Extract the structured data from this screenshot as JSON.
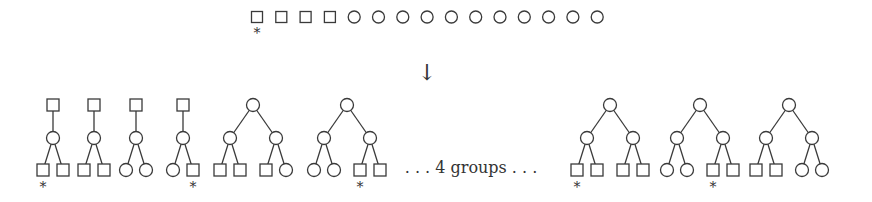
{
  "diagram": {
    "top_row": {
      "nodes": [
        "square",
        "square",
        "square",
        "square",
        "circle",
        "circle",
        "circle",
        "circle",
        "circle",
        "circle",
        "circle",
        "circle",
        "circle",
        "circle",
        "circle"
      ],
      "starred_index": 0
    },
    "arrow": "↓",
    "groups_label": ". . . 4 groups . . .",
    "star_glyph": "*",
    "trees_left": [
      {
        "type": "chain",
        "root": "square",
        "mid": "circle",
        "leaves": [
          "square",
          "square"
        ],
        "star_leaf": 0
      },
      {
        "type": "chain",
        "root": "square",
        "mid": "circle",
        "leaves": [
          "square",
          "square"
        ],
        "star_leaf": null
      },
      {
        "type": "chain",
        "root": "square",
        "mid": "circle",
        "leaves": [
          "circle",
          "circle"
        ],
        "star_leaf": null
      },
      {
        "type": "chain",
        "root": "square",
        "mid": "circle",
        "leaves": [
          "circle",
          "square"
        ],
        "star_leaf": 1
      },
      {
        "type": "binary",
        "root": "circle",
        "mids": [
          "circle",
          "circle"
        ],
        "leaves": [
          "square",
          "square",
          "square",
          "circle"
        ],
        "star_leaf": null
      },
      {
        "type": "binary",
        "root": "circle",
        "mids": [
          "circle",
          "circle"
        ],
        "leaves": [
          "circle",
          "circle",
          "square",
          "square"
        ],
        "star_leaf": 2
      }
    ],
    "trees_right": [
      {
        "type": "binary",
        "root": "circle",
        "mids": [
          "circle",
          "circle"
        ],
        "leaves": [
          "square",
          "square",
          "square",
          "square"
        ],
        "star_leaf": 0
      },
      {
        "type": "binary",
        "root": "circle",
        "mids": [
          "circle",
          "circle"
        ],
        "leaves": [
          "circle",
          "circle",
          "square",
          "square"
        ],
        "star_leaf": 2
      },
      {
        "type": "binary",
        "root": "circle",
        "mids": [
          "circle",
          "circle"
        ],
        "leaves": [
          "square",
          "square",
          "circle",
          "circle"
        ],
        "star_leaf": null
      }
    ]
  }
}
